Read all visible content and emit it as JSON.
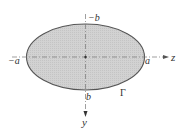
{
  "diagram": {
    "type": "elliptical cross-section",
    "shape": {
      "name": "ellipse",
      "boundary_label": "Γ",
      "fill_color": "#cfcfcf",
      "stroke_color": "#555555"
    },
    "axes": {
      "horizontal": {
        "name": "z",
        "label": "z",
        "negative_intercept": "−a",
        "positive_intercept": "a"
      },
      "vertical": {
        "name": "y",
        "label": "y",
        "direction": "downward",
        "top_intercept": "−b",
        "bottom_intercept": "b"
      }
    }
  }
}
